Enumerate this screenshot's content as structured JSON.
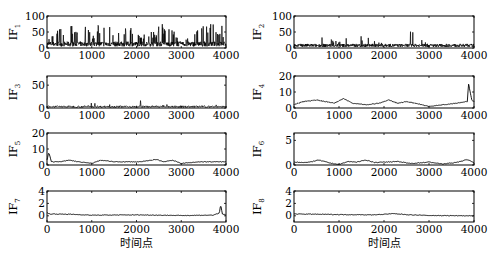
{
  "chart_data": [
    {
      "type": "line",
      "ylabel": "IF",
      "ysub": "1",
      "xlim": [
        0,
        4000
      ],
      "ylim": [
        0,
        100
      ],
      "yticks": [
        0,
        50,
        100
      ],
      "xticks": [
        0,
        1000,
        2000,
        3000,
        4000
      ],
      "xlabel": "",
      "description": "Highly oscillatory component with frequent spikes up to ~80",
      "x": [
        0,
        100,
        200,
        300,
        400,
        600,
        800,
        900,
        1000,
        1100,
        1200,
        1300,
        1400,
        1600,
        1800,
        2000,
        2400,
        2600,
        2800,
        3000,
        3200,
        3400,
        3600,
        3800,
        3900,
        4000
      ],
      "values": [
        10,
        60,
        40,
        80,
        70,
        80,
        75,
        80,
        40,
        75,
        80,
        80,
        80,
        60,
        80,
        40,
        60,
        80,
        60,
        20,
        50,
        60,
        80,
        70,
        80,
        20
      ]
    },
    {
      "type": "line",
      "ylabel": "IF",
      "ysub": "2",
      "xlim": [
        0,
        4000
      ],
      "ylim": [
        0,
        100
      ],
      "yticks": [
        0,
        50,
        100
      ],
      "xticks": [
        0,
        1000,
        2000,
        3000,
        4000
      ],
      "xlabel": "",
      "description": "Oscillatory component mostly ~10 with spikes to ~65",
      "x": [
        0,
        200,
        400,
        500,
        700,
        1000,
        1100,
        1200,
        1300,
        1400,
        1800,
        2000,
        2300,
        2500,
        2700,
        3000,
        3500,
        4000
      ],
      "values": [
        5,
        15,
        45,
        45,
        35,
        20,
        60,
        35,
        50,
        40,
        30,
        15,
        10,
        45,
        65,
        10,
        10,
        10
      ]
    },
    {
      "type": "line",
      "ylabel": "IF",
      "ysub": "3",
      "xlim": [
        0,
        4000
      ],
      "ylim": [
        0,
        70
      ],
      "yticks": [
        0,
        50
      ],
      "xticks": [
        0,
        1000,
        2000,
        3000,
        4000
      ],
      "xlabel": "",
      "x": [
        0,
        200,
        500,
        600,
        900,
        1100,
        1250,
        1500,
        2000,
        2050,
        2200,
        2700,
        2900,
        3200,
        3600,
        3800,
        3900,
        4000
      ],
      "values": [
        3,
        5,
        5,
        15,
        8,
        15,
        25,
        5,
        5,
        40,
        5,
        8,
        5,
        15,
        15,
        10,
        30,
        5
      ]
    },
    {
      "type": "line",
      "ylabel": "IF",
      "ysub": "4",
      "xlim": [
        0,
        4000
      ],
      "ylim": [
        0,
        20
      ],
      "yticks": [
        0,
        10,
        20
      ],
      "xticks": [
        0,
        1000,
        2000,
        3000,
        4000
      ],
      "xlabel": "",
      "x": [
        0,
        200,
        500,
        700,
        900,
        1100,
        1300,
        1600,
        1900,
        2100,
        2300,
        2500,
        2700,
        3000,
        3300,
        3600,
        3850,
        3880,
        3950,
        4000
      ],
      "values": [
        2,
        4,
        5,
        4,
        3,
        6,
        3,
        2,
        3,
        5,
        3,
        4,
        3,
        1,
        2,
        3,
        4,
        15,
        5,
        4
      ]
    },
    {
      "type": "line",
      "ylabel": "IF",
      "ysub": "5",
      "xlim": [
        0,
        4000
      ],
      "ylim": [
        0,
        20
      ],
      "yticks": [
        0,
        10,
        20
      ],
      "xticks": [
        0,
        1000,
        2000,
        3000,
        4000
      ],
      "xlabel": "",
      "x": [
        0,
        40,
        100,
        300,
        500,
        700,
        1000,
        1200,
        1500,
        1800,
        2100,
        2450,
        2600,
        2800,
        3000,
        3400,
        3800,
        4000
      ],
      "values": [
        3,
        8,
        2,
        2,
        3,
        2,
        1,
        3,
        2,
        2,
        2,
        3.5,
        2,
        3,
        1,
        2,
        2,
        2
      ]
    },
    {
      "type": "line",
      "ylabel": "IF",
      "ysub": "6",
      "xlim": [
        0,
        4000
      ],
      "ylim": [
        0,
        6.5
      ],
      "yticks": [
        0,
        5
      ],
      "xticks": [
        0,
        1000,
        2000,
        3000,
        4000
      ],
      "xlabel": "",
      "x": [
        0,
        300,
        550,
        800,
        1000,
        1200,
        1400,
        1600,
        1800,
        2000,
        2300,
        2600,
        3000,
        3300,
        3600,
        3850,
        4000
      ],
      "values": [
        0.6,
        0.5,
        1.0,
        0.4,
        0.1,
        0.7,
        0.6,
        1.0,
        0.5,
        0.6,
        0.7,
        0.3,
        0.6,
        0.2,
        0.5,
        1.1,
        0.5
      ]
    },
    {
      "type": "line",
      "ylabel": "IF",
      "ysub": "7",
      "xlim": [
        0,
        4000
      ],
      "ylim": [
        -1,
        4
      ],
      "yticks": [
        0,
        2,
        4
      ],
      "xticks": [
        0,
        1000,
        2000,
        3000,
        4000
      ],
      "xlabel": "时间点",
      "x": [
        0,
        50,
        500,
        1000,
        2000,
        3000,
        3700,
        3850,
        3880,
        3920,
        4000
      ],
      "values": [
        0.5,
        0.3,
        0.25,
        0.1,
        0.15,
        0.05,
        0.1,
        0.4,
        1.8,
        0.3,
        0.1
      ]
    },
    {
      "type": "line",
      "ylabel": "IF",
      "ysub": "8",
      "xlim": [
        0,
        4000
      ],
      "ylim": [
        -1,
        4
      ],
      "yticks": [
        0,
        2,
        4
      ],
      "xticks": [
        0,
        1000,
        2000,
        3000,
        4000
      ],
      "xlabel": "时间点",
      "x": [
        0,
        1000,
        1800,
        2200,
        2600,
        3000,
        4000
      ],
      "values": [
        0.3,
        0.2,
        0.15,
        0.35,
        0.15,
        0.05,
        0.0
      ]
    }
  ]
}
